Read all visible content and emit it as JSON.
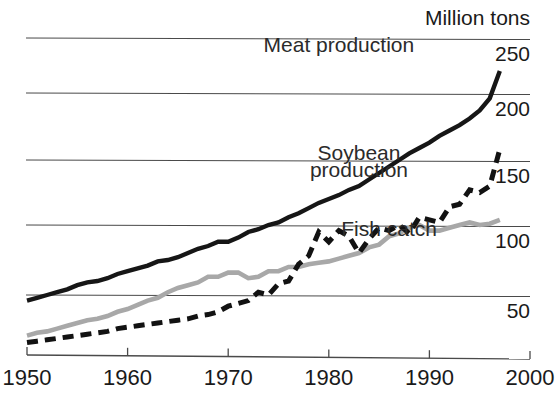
{
  "chart_data": {
    "type": "line",
    "title": "",
    "unit_label": "Million tons",
    "xlabel": "",
    "ylabel": "Million tons",
    "xlim": [
      1950,
      2000
    ],
    "ylim": [
      0,
      262
    ],
    "grid": true,
    "gridlines": [
      50,
      100,
      150,
      200,
      250
    ],
    "legend_position": "inline-annotations",
    "x_ticks": [
      "1950",
      "1960",
      "1970",
      "1980",
      "1990",
      "2000"
    ],
    "x_tick_values": [
      1950,
      1960,
      1970,
      1980,
      1990,
      2000
    ],
    "y_ticks": [
      "50",
      "100",
      "150",
      "200",
      "250"
    ],
    "y_tick_values": [
      50,
      100,
      150,
      200,
      250
    ],
    "series": [
      {
        "name": "Meat production",
        "style": "solid",
        "color": "#161616",
        "x": [
          1950,
          1951,
          1952,
          1953,
          1954,
          1955,
          1956,
          1957,
          1958,
          1959,
          1960,
          1961,
          1962,
          1963,
          1964,
          1965,
          1966,
          1967,
          1968,
          1969,
          1970,
          1971,
          1972,
          1973,
          1974,
          1975,
          1976,
          1977,
          1978,
          1979,
          1980,
          1981,
          1982,
          1983,
          1984,
          1985,
          1986,
          1987,
          1988,
          1989,
          1990,
          1991,
          1992,
          1993,
          1994,
          1995,
          1996,
          1997
        ],
        "values": [
          46,
          48,
          50,
          52,
          54,
          57,
          59,
          60,
          62,
          65,
          67,
          69,
          71,
          74,
          75,
          77,
          80,
          83,
          85,
          88,
          88,
          91,
          95,
          97,
          100,
          102,
          106,
          109,
          113,
          117,
          120,
          123,
          127,
          130,
          135,
          140,
          145,
          150,
          155,
          159,
          163,
          168,
          172,
          176,
          181,
          187,
          196,
          220
        ]
      },
      {
        "name": "Soybean production",
        "style": "dashed",
        "color": "#121212",
        "x": [
          1950,
          1951,
          1952,
          1953,
          1954,
          1955,
          1956,
          1957,
          1958,
          1959,
          1960,
          1961,
          1962,
          1963,
          1964,
          1965,
          1966,
          1967,
          1968,
          1969,
          1970,
          1971,
          1972,
          1973,
          1974,
          1975,
          1976,
          1977,
          1978,
          1979,
          1980,
          1981,
          1982,
          1983,
          1984,
          1985,
          1986,
          1987,
          1988,
          1989,
          1990,
          1991,
          1992,
          1993,
          1994,
          1995,
          1996,
          1997
        ],
        "values": [
          16,
          17,
          18,
          19,
          20,
          21,
          22,
          23,
          24,
          26,
          27,
          28,
          29,
          30,
          31,
          32,
          33,
          35,
          36,
          38,
          42,
          44,
          46,
          52,
          50,
          58,
          60,
          72,
          78,
          95,
          88,
          96,
          92,
          80,
          90,
          98,
          96,
          100,
          94,
          106,
          104,
          102,
          114,
          116,
          127,
          125,
          130,
          158
        ]
      },
      {
        "name": "Fish catch",
        "style": "solid",
        "color": "#a8a8a8",
        "x": [
          1950,
          1951,
          1952,
          1953,
          1954,
          1955,
          1956,
          1957,
          1958,
          1959,
          1960,
          1961,
          1962,
          1963,
          1964,
          1965,
          1966,
          1967,
          1968,
          1969,
          1970,
          1971,
          1972,
          1973,
          1974,
          1975,
          1976,
          1977,
          1978,
          1979,
          1980,
          1981,
          1982,
          1983,
          1984,
          1985,
          1986,
          1987,
          1988,
          1989,
          1990,
          1991,
          1992,
          1993,
          1994,
          1995,
          1996,
          1997
        ],
        "values": [
          21,
          23,
          24,
          26,
          28,
          30,
          32,
          33,
          35,
          38,
          40,
          43,
          46,
          48,
          52,
          55,
          57,
          59,
          63,
          63,
          66,
          66,
          62,
          63,
          67,
          67,
          70,
          70,
          72,
          73,
          74,
          76,
          78,
          80,
          84,
          86,
          92,
          94,
          98,
          100,
          96,
          96,
          98,
          100,
          102,
          100,
          101,
          104
        ]
      }
    ],
    "annotations": [
      {
        "name": "meat-annotation",
        "text": "Meat production",
        "x": 1981,
        "y": 237
      },
      {
        "name": "soybean-annotation-line1",
        "text": "Soybean",
        "x": 1983,
        "y": 150
      },
      {
        "name": "soybean-annotation-line2",
        "text": "production",
        "x": 1983,
        "y": 137
      },
      {
        "name": "fish-annotation",
        "text": "Fish catch",
        "x": 1986,
        "y": 92
      }
    ],
    "colors": {
      "meat": "#161616",
      "soybean": "#121212",
      "fish": "#a8a8a8",
      "grid": "#4a4a4a",
      "background": "#ffffff"
    }
  }
}
